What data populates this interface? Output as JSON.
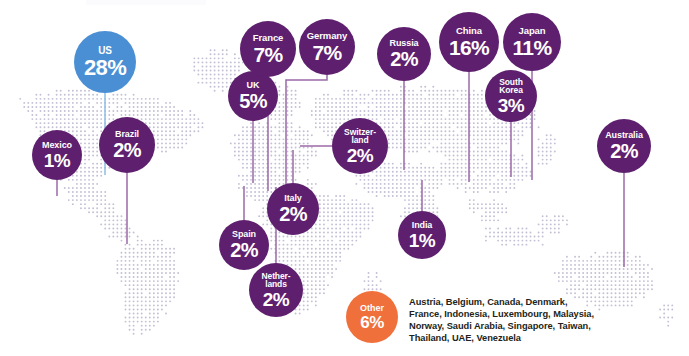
{
  "chart_data": {
    "type": "map",
    "title": "",
    "unit": "percent",
    "value_suffix": "%",
    "colors": {
      "primary_bubble": "#5e1f6e",
      "highlight_bubble": "#4a8fd4",
      "other_badge": "#f0703c",
      "connector": "#9b6aa8",
      "connector_highlight": "#8fbde6",
      "map_dot": "#b8b4cd",
      "background": "#ffffff",
      "legend_text": "#231f20"
    },
    "series_name": "Share by country",
    "categories": [
      "US",
      "Mexico",
      "Brazil",
      "UK",
      "France",
      "Germany",
      "Spain",
      "Netherlands",
      "Italy",
      "Switzerland",
      "Russia",
      "China",
      "South Korea",
      "Japan",
      "India",
      "Australia",
      "Other"
    ],
    "values": [
      28,
      1,
      2,
      5,
      7,
      7,
      2,
      2,
      2,
      2,
      2,
      16,
      3,
      11,
      1,
      2,
      6
    ],
    "legend_position": "bottom-right",
    "grid": false
  },
  "map": {
    "name": "world-dot-map",
    "style": "halftone-dot-grid"
  },
  "bubbles": [
    {
      "id": "us",
      "name": "US",
      "name_display": "US",
      "value": "28%",
      "cx": 105,
      "cy": 62,
      "r": 31,
      "color": "#4a8fd4",
      "name_size": 10,
      "value_size": 22,
      "line": {
        "type": "straight",
        "x1": 105,
        "y1": 93,
        "x2": 105,
        "y2": 175,
        "color": "#8fbde6"
      }
    },
    {
      "id": "mexico",
      "name": "Mexico",
      "name_display": "Mexico",
      "value": "1%",
      "cx": 57,
      "cy": 155,
      "r": 25,
      "color": "#5e1f6e",
      "name_size": 9,
      "value_size": 19,
      "line": {
        "type": "straight",
        "x1": 57,
        "y1": 180,
        "x2": 57,
        "y2": 196,
        "color": "#9b6aa8"
      }
    },
    {
      "id": "brazil",
      "name": "Brazil",
      "name_display": "Brazil",
      "value": "2%",
      "cx": 127,
      "cy": 145,
      "r": 28,
      "color": "#5e1f6e",
      "name_size": 9,
      "value_size": 20,
      "line": {
        "type": "straight",
        "x1": 127,
        "y1": 173,
        "x2": 127,
        "y2": 244,
        "color": "#9b6aa8"
      }
    },
    {
      "id": "uk",
      "name": "UK",
      "name_display": "UK",
      "value": "5%",
      "cx": 253,
      "cy": 96,
      "r": 25,
      "color": "#5e1f6e",
      "name_size": 9,
      "value_size": 20,
      "line": {
        "type": "straight",
        "x1": 253,
        "y1": 121,
        "x2": 253,
        "y2": 183,
        "color": "#9b6aa8"
      }
    },
    {
      "id": "france",
      "name": "France",
      "name_display": "France",
      "value": "7%",
      "cx": 268,
      "cy": 49,
      "r": 28,
      "color": "#5e1f6e",
      "name_size": 9.5,
      "value_size": 21,
      "line": {
        "type": "straight",
        "x1": 268,
        "y1": 77,
        "x2": 268,
        "y2": 191,
        "color": "#9b6aa8"
      }
    },
    {
      "id": "germany",
      "name": "Germany",
      "name_display": "Germany",
      "value": "7%",
      "cx": 327,
      "cy": 47,
      "r": 28,
      "color": "#5e1f6e",
      "name_size": 9.5,
      "value_size": 21,
      "line": {
        "type": "elbow",
        "x1": 327,
        "y1": 75,
        "x2": 327,
        "y2": 80,
        "x3": 286,
        "y3": 80,
        "x4": 286,
        "y4": 186,
        "color": "#9b6aa8"
      }
    },
    {
      "id": "spain",
      "name": "Spain",
      "name_display": "Spain",
      "value": "2%",
      "cx": 244,
      "cy": 245,
      "r": 25,
      "color": "#5e1f6e",
      "name_size": 9,
      "value_size": 20,
      "line": {
        "type": "straight",
        "x1": 244,
        "y1": 220,
        "x2": 244,
        "y2": 186,
        "color": "#9b6aa8"
      }
    },
    {
      "id": "netherlands",
      "name": "Netherlands",
      "name_display": "Nether-\nlands",
      "value": "2%",
      "cx": 276,
      "cy": 290,
      "r": 27,
      "color": "#5e1f6e",
      "name_size": 8.5,
      "value_size": 19,
      "line": {
        "type": "straight",
        "x1": 276,
        "y1": 263,
        "x2": 276,
        "y2": 187,
        "color": "#9b6aa8"
      }
    },
    {
      "id": "italy",
      "name": "Italy",
      "name_display": "Italy",
      "value": "2%",
      "cx": 293,
      "cy": 209,
      "r": 26,
      "color": "#5e1f6e",
      "name_size": 9,
      "value_size": 20,
      "line": {
        "type": "straight",
        "x1": 293,
        "y1": 183,
        "x2": 293,
        "y2": 150,
        "color": "#9b6aa8"
      }
    },
    {
      "id": "switzerland",
      "name": "Switzerland",
      "name_display": "Switzer-\nland",
      "value": "2%",
      "cx": 360,
      "cy": 146,
      "r": 28,
      "color": "#5e1f6e",
      "name_size": 8.5,
      "value_size": 19,
      "line": {
        "type": "elbow-left",
        "x1": 332,
        "y1": 146,
        "x2": 300,
        "y2": 146,
        "color": "#9b6aa8"
      }
    },
    {
      "id": "russia",
      "name": "Russia",
      "name_display": "Russia",
      "value": "2%",
      "cx": 404,
      "cy": 54,
      "r": 27,
      "color": "#5e1f6e",
      "name_size": 9,
      "value_size": 20,
      "line": {
        "type": "straight",
        "x1": 404,
        "y1": 81,
        "x2": 404,
        "y2": 170,
        "color": "#9b6aa8"
      }
    },
    {
      "id": "china",
      "name": "China",
      "name_display": "China",
      "value": "16%",
      "cx": 469,
      "cy": 42,
      "r": 30,
      "color": "#5e1f6e",
      "name_size": 9.5,
      "value_size": 21,
      "line": {
        "type": "straight",
        "x1": 469,
        "y1": 72,
        "x2": 469,
        "y2": 182,
        "color": "#9b6aa8"
      }
    },
    {
      "id": "south-korea",
      "name": "South Korea",
      "name_display": "South\nKorea",
      "value": "3%",
      "cx": 511,
      "cy": 96,
      "r": 26,
      "color": "#5e1f6e",
      "name_size": 8.5,
      "value_size": 19,
      "line": {
        "type": "straight",
        "x1": 511,
        "y1": 122,
        "x2": 511,
        "y2": 177,
        "color": "#9b6aa8"
      }
    },
    {
      "id": "japan",
      "name": "Japan",
      "name_display": "Japan",
      "value": "11%",
      "cx": 532,
      "cy": 42,
      "r": 29,
      "color": "#5e1f6e",
      "name_size": 9.5,
      "value_size": 21,
      "line": {
        "type": "straight",
        "x1": 532,
        "y1": 71,
        "x2": 532,
        "y2": 180,
        "color": "#9b6aa8"
      }
    },
    {
      "id": "india",
      "name": "India",
      "name_display": "India",
      "value": "1%",
      "cx": 422,
      "cy": 235,
      "r": 24,
      "color": "#5e1f6e",
      "name_size": 9,
      "value_size": 19,
      "line": {
        "type": "straight",
        "x1": 422,
        "y1": 211,
        "x2": 422,
        "y2": 180,
        "color": "#9b6aa8"
      }
    },
    {
      "id": "australia",
      "name": "Australia",
      "name_display": "Australia",
      "value": "2%",
      "cx": 624,
      "cy": 146,
      "r": 27,
      "color": "#5e1f6e",
      "name_size": 9,
      "value_size": 20,
      "line": {
        "type": "straight",
        "x1": 624,
        "y1": 173,
        "x2": 624,
        "y2": 267,
        "color": "#9b6aa8"
      }
    }
  ],
  "legend": {
    "badge_name": "Other",
    "badge_value": "6%",
    "badge_color": "#f0703c",
    "countries_text": "Austria, Belgium, Canada, Denmark,\nFrance, Indonesia, Luxembourg, Malaysia,\nNorway, Saudi Arabia, Singapore, Taiwan,\nThailand, UAE, Venezuela",
    "countries": [
      "Austria",
      "Belgium",
      "Canada",
      "Denmark",
      "France",
      "Indonesia",
      "Luxembourg",
      "Malaysia",
      "Norway",
      "Saudi Arabia",
      "Singapore",
      "Taiwan",
      "Thailand",
      "UAE",
      "Venezuela"
    ]
  }
}
